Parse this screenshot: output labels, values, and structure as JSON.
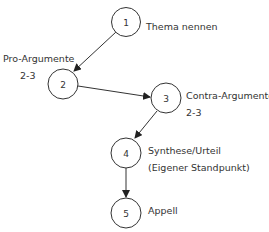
{
  "diagram": {
    "nodes": [
      {
        "id": "1",
        "number": "1",
        "label": "Thema nennen",
        "sublabel": ""
      },
      {
        "id": "2",
        "number": "2",
        "label": "Pro-Argumente",
        "sublabel": "2-3"
      },
      {
        "id": "3",
        "number": "3",
        "label": "Contra-Argumente",
        "sublabel": "2-3"
      },
      {
        "id": "4",
        "number": "4",
        "label": "Synthese/Urteil",
        "sublabel": "(Eigener Standpunkt)"
      },
      {
        "id": "5",
        "number": "5",
        "label": "Appell",
        "sublabel": ""
      }
    ],
    "edges": [
      {
        "from": "1",
        "to": "2"
      },
      {
        "from": "2",
        "to": "3"
      },
      {
        "from": "3",
        "to": "4"
      },
      {
        "from": "4",
        "to": "5"
      }
    ]
  }
}
